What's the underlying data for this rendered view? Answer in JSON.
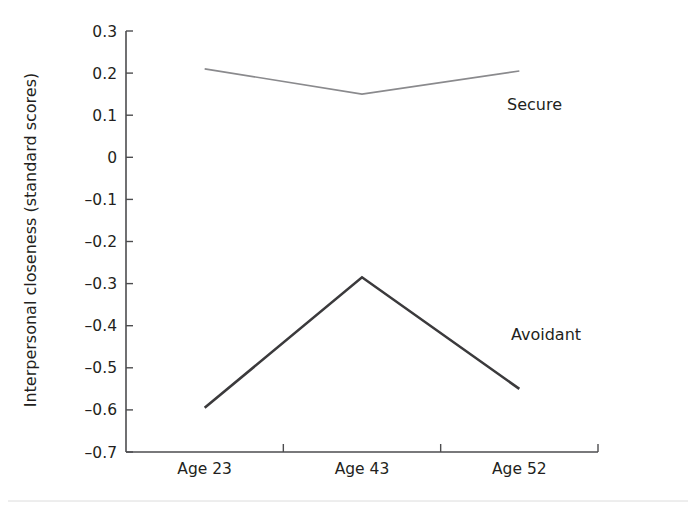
{
  "chart_data": {
    "type": "line",
    "title": "",
    "xlabel": "",
    "ylabel": "Interpersonal closeness (standard scores)",
    "categories": [
      "Age 23",
      "Age 43",
      "Age 52"
    ],
    "series": [
      {
        "name": "Secure",
        "values": [
          0.21,
          0.15,
          0.205
        ],
        "color": "#8a8a8d",
        "line_width": 1.6
      },
      {
        "name": "Avoidant",
        "values": [
          -0.595,
          -0.285,
          -0.55
        ],
        "color": "#3b3a3c",
        "line_width": 2.6
      }
    ],
    "ylim": [
      -0.7,
      0.3
    ],
    "yticks": [
      0.3,
      0.2,
      0.1,
      0,
      -0.1,
      -0.2,
      -0.3,
      -0.4,
      -0.5,
      -0.6,
      -0.7
    ],
    "ytick_labels": [
      "0.3",
      "0.2",
      "0.1",
      "0",
      "–0.1",
      "–0.2",
      "–0.3",
      "–0.4",
      "–0.5",
      "–0.6",
      "–0.7"
    ],
    "grid": false,
    "legend_position": "inline-right",
    "annotations": [
      {
        "text": "Secure",
        "series": "Secure"
      },
      {
        "text": "Avoidant",
        "series": "Avoidant"
      }
    ]
  },
  "axis": {
    "y_title": "Interpersonal closeness (standard scores)",
    "y_ticks": [
      "0.3",
      "0.2",
      "0.1",
      "0",
      "–0.1",
      "–0.2",
      "–0.3",
      "–0.4",
      "–0.5",
      "–0.6",
      "–0.7"
    ],
    "x_ticks": [
      "Age 23",
      "Age 43",
      "Age 52"
    ]
  },
  "labels": {
    "secure": "Secure",
    "avoidant": "Avoidant"
  }
}
